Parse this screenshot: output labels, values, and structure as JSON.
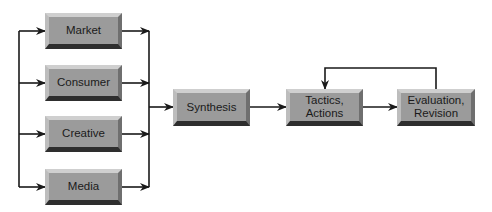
{
  "diagram": {
    "nodes": [
      {
        "id": "market",
        "label": "Market"
      },
      {
        "id": "consumer",
        "label": "Consumer"
      },
      {
        "id": "creative",
        "label": "Creative"
      },
      {
        "id": "media",
        "label": "Media"
      },
      {
        "id": "synthesis",
        "label": "Synthesis"
      },
      {
        "id": "tactics",
        "label": "Tactics,\nActions"
      },
      {
        "id": "evaluation",
        "label": "Evaluation,\nRevision"
      }
    ],
    "edges": [
      {
        "from": "input",
        "to": "market"
      },
      {
        "from": "input",
        "to": "consumer"
      },
      {
        "from": "input",
        "to": "creative"
      },
      {
        "from": "input",
        "to": "media"
      },
      {
        "from": "market",
        "to": "synthesis"
      },
      {
        "from": "consumer",
        "to": "synthesis"
      },
      {
        "from": "creative",
        "to": "synthesis"
      },
      {
        "from": "media",
        "to": "synthesis"
      },
      {
        "from": "synthesis",
        "to": "tactics"
      },
      {
        "from": "tactics",
        "to": "evaluation"
      },
      {
        "from": "evaluation",
        "to": "tactics"
      }
    ],
    "colors": {
      "box_face": "#9b9b9b",
      "line": "#1a1a1a",
      "background": "#ffffff"
    }
  }
}
